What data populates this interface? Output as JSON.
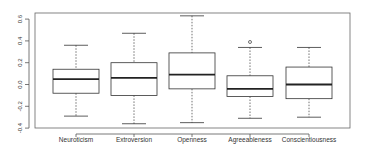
{
  "chart_data": {
    "type": "boxplot",
    "title": "",
    "xlabel": "",
    "ylabel": "",
    "ylim": [
      -0.4,
      0.63
    ],
    "yticks": [
      -0.4,
      -0.2,
      0.0,
      0.2,
      0.4,
      0.6
    ],
    "ytick_labels": [
      "-0.4",
      "-0.2",
      "0.0",
      "0.2",
      "0.4",
      "0.6"
    ],
    "grid": false,
    "legend": null,
    "categories": [
      "Neuroticism",
      "Extroversion",
      "Openness",
      "Agreeableness",
      "Conscientiousness"
    ],
    "boxes": [
      {
        "name": "Neuroticism",
        "whisker_low": -0.29,
        "q1": -0.08,
        "median": 0.05,
        "q3": 0.14,
        "whisker_high": 0.36,
        "outliers": []
      },
      {
        "name": "Extroversion",
        "whisker_low": -0.36,
        "q1": -0.1,
        "median": 0.06,
        "q3": 0.2,
        "whisker_high": 0.47,
        "outliers": []
      },
      {
        "name": "Openness",
        "whisker_low": -0.35,
        "q1": -0.04,
        "median": 0.09,
        "q3": 0.29,
        "whisker_high": 0.63,
        "outliers": []
      },
      {
        "name": "Agreeableness",
        "whisker_low": -0.31,
        "q1": -0.11,
        "median": -0.04,
        "q3": 0.08,
        "whisker_high": 0.34,
        "outliers": [
          0.39
        ]
      },
      {
        "name": "Conscientiousness",
        "whisker_low": -0.3,
        "q1": -0.13,
        "median": 0.0,
        "q3": 0.16,
        "whisker_high": 0.34,
        "outliers": []
      }
    ]
  },
  "style": {
    "line_color": "#333333",
    "frame_color": "#555555",
    "median_color": "#222222",
    "background": "#ffffff"
  }
}
